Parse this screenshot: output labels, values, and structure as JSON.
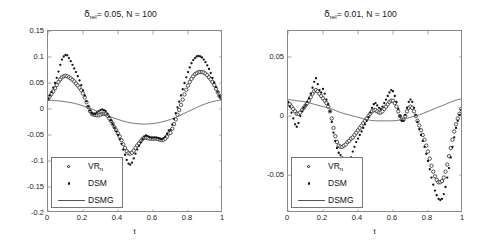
{
  "figure": {
    "axis_label_x": "t",
    "legend": [
      {
        "key": "vr",
        "label": "VR",
        "sublabel": "n",
        "marker": "open-circle"
      },
      {
        "key": "dsm",
        "label": "DSM",
        "sublabel": "",
        "marker": "filled-dot"
      },
      {
        "key": "dsmg",
        "label": "DSMG",
        "sublabel": "",
        "marker": "solid-line"
      }
    ],
    "colors": {
      "axis": "#8a8a8a",
      "marker": "#111111",
      "line": "#555555",
      "text": "#1a1a1a"
    }
  },
  "panels": [
    {
      "id": "left",
      "title_prefix": "δ",
      "title_sub": "rel",
      "title_rest": "= 0.05, N = 100",
      "title_full": "δrel = 0.05, N = 100"
    },
    {
      "id": "right",
      "title_prefix": "δ",
      "title_sub": "rel",
      "title_rest": "= 0.01, N = 100",
      "title_full": "δrel = 0.01, N = 100"
    }
  ],
  "chart_data": [
    {
      "type": "scatter",
      "panel": "left",
      "title": "δ_rel = 0.05, N = 100",
      "xlabel": "t",
      "ylabel": "",
      "xlim": [
        0,
        1
      ],
      "ylim": [
        -0.2,
        0.15
      ],
      "xticks": [
        0,
        0.2,
        0.4,
        0.6,
        0.8,
        1
      ],
      "xticklabels": [
        "0",
        "0.2",
        "0.4",
        "0.6",
        "0.8",
        "1"
      ],
      "yticks": [
        0.15,
        0.1,
        0.05,
        0,
        -0.05,
        -0.1,
        -0.15,
        -0.2
      ],
      "yticklabels": [
        "0.15",
        "0.1",
        "0.05",
        "0",
        "-0.05",
        "-0.1",
        "-0.15",
        "-0.2"
      ],
      "grid": false,
      "legend_position": "lower left",
      "series": [
        {
          "name": "VR_n",
          "marker": "open-circle",
          "x": [
            0.0,
            0.01,
            0.02,
            0.03,
            0.04,
            0.05,
            0.06,
            0.07,
            0.08,
            0.09,
            0.1,
            0.11,
            0.12,
            0.13,
            0.14,
            0.15,
            0.16,
            0.17,
            0.18,
            0.19,
            0.2,
            0.21,
            0.22,
            0.23,
            0.24,
            0.25,
            0.26,
            0.27,
            0.28,
            0.29,
            0.3,
            0.31,
            0.32,
            0.33,
            0.34,
            0.35,
            0.36,
            0.37,
            0.38,
            0.39,
            0.4,
            0.41,
            0.42,
            0.43,
            0.44,
            0.45,
            0.46,
            0.47,
            0.48,
            0.49,
            0.5,
            0.51,
            0.52,
            0.53,
            0.54,
            0.55,
            0.56,
            0.57,
            0.58,
            0.59,
            0.6,
            0.61,
            0.62,
            0.63,
            0.64,
            0.65,
            0.66,
            0.67,
            0.68,
            0.69,
            0.7,
            0.71,
            0.72,
            0.73,
            0.74,
            0.75,
            0.76,
            0.77,
            0.78,
            0.79,
            0.8,
            0.81,
            0.82,
            0.83,
            0.84,
            0.85,
            0.86,
            0.87,
            0.88,
            0.89,
            0.9,
            0.91,
            0.92,
            0.93,
            0.94,
            0.95,
            0.96,
            0.97,
            0.98,
            0.99,
            1.0
          ],
          "y": [
            0.019,
            0.024,
            0.029,
            0.034,
            0.04,
            0.046,
            0.052,
            0.057,
            0.061,
            0.063,
            0.064,
            0.063,
            0.061,
            0.059,
            0.056,
            0.053,
            0.049,
            0.045,
            0.041,
            0.036,
            0.03,
            0.022,
            0.013,
            0.004,
            -0.004,
            -0.009,
            -0.011,
            -0.011,
            -0.012,
            -0.012,
            -0.011,
            -0.009,
            -0.009,
            -0.01,
            -0.013,
            -0.018,
            -0.023,
            -0.029,
            -0.035,
            -0.041,
            -0.047,
            -0.053,
            -0.06,
            -0.068,
            -0.075,
            -0.081,
            -0.085,
            -0.086,
            -0.084,
            -0.08,
            -0.075,
            -0.07,
            -0.066,
            -0.062,
            -0.058,
            -0.055,
            -0.055,
            -0.056,
            -0.057,
            -0.057,
            -0.057,
            -0.057,
            -0.057,
            -0.058,
            -0.059,
            -0.06,
            -0.059,
            -0.057,
            -0.053,
            -0.047,
            -0.046,
            -0.038,
            -0.029,
            -0.02,
            -0.011,
            -0.002,
            0.008,
            0.018,
            0.028,
            0.037,
            0.045,
            0.052,
            0.058,
            0.063,
            0.067,
            0.069,
            0.071,
            0.071,
            0.071,
            0.07,
            0.068,
            0.065,
            0.061,
            0.057,
            0.052,
            0.046,
            0.039,
            0.032,
            0.025,
            0.021
          ]
        },
        {
          "name": "DSM",
          "marker": "filled-dot",
          "x": [
            0.0,
            0.01,
            0.02,
            0.03,
            0.04,
            0.05,
            0.06,
            0.07,
            0.08,
            0.09,
            0.1,
            0.11,
            0.12,
            0.13,
            0.14,
            0.15,
            0.16,
            0.17,
            0.18,
            0.19,
            0.2,
            0.21,
            0.22,
            0.23,
            0.24,
            0.25,
            0.26,
            0.27,
            0.28,
            0.29,
            0.3,
            0.31,
            0.32,
            0.33,
            0.34,
            0.35,
            0.36,
            0.37,
            0.38,
            0.39,
            0.4,
            0.41,
            0.42,
            0.43,
            0.44,
            0.45,
            0.46,
            0.47,
            0.48,
            0.49,
            0.5,
            0.51,
            0.52,
            0.53,
            0.54,
            0.55,
            0.56,
            0.57,
            0.58,
            0.59,
            0.6,
            0.61,
            0.62,
            0.63,
            0.64,
            0.65,
            0.66,
            0.67,
            0.68,
            0.69,
            0.7,
            0.71,
            0.72,
            0.73,
            0.74,
            0.75,
            0.76,
            0.77,
            0.78,
            0.79,
            0.8,
            0.81,
            0.82,
            0.83,
            0.84,
            0.85,
            0.86,
            0.87,
            0.88,
            0.89,
            0.9,
            0.91,
            0.92,
            0.93,
            0.94,
            0.95,
            0.96,
            0.97,
            0.98,
            0.99,
            1.0
          ],
          "y": [
            0.019,
            0.026,
            0.033,
            0.041,
            0.05,
            0.06,
            0.072,
            0.085,
            0.095,
            0.101,
            0.104,
            0.103,
            0.098,
            0.092,
            0.085,
            0.078,
            0.071,
            0.063,
            0.055,
            0.046,
            0.036,
            0.026,
            0.015,
            0.005,
            -0.003,
            -0.008,
            -0.01,
            -0.009,
            -0.006,
            -0.004,
            -0.002,
            -0.001,
            -0.002,
            -0.004,
            -0.009,
            -0.015,
            -0.022,
            -0.029,
            -0.036,
            -0.043,
            -0.05,
            -0.058,
            -0.067,
            -0.078,
            -0.088,
            -0.098,
            -0.105,
            -0.107,
            -0.103,
            -0.095,
            -0.086,
            -0.078,
            -0.071,
            -0.064,
            -0.058,
            -0.053,
            -0.051,
            -0.052,
            -0.054,
            -0.055,
            -0.055,
            -0.055,
            -0.055,
            -0.056,
            -0.057,
            -0.058,
            -0.056,
            -0.053,
            -0.048,
            -0.041,
            -0.04,
            -0.03,
            -0.019,
            -0.008,
            0.003,
            0.014,
            0.026,
            0.038,
            0.05,
            0.061,
            0.071,
            0.08,
            0.088,
            0.094,
            0.098,
            0.101,
            0.102,
            0.101,
            0.099,
            0.095,
            0.09,
            0.084,
            0.077,
            0.069,
            0.06,
            0.051,
            0.042,
            0.033,
            0.025,
            0.021
          ]
        },
        {
          "name": "DSMG",
          "marker": "solid-line",
          "x": [
            0.0,
            0.05,
            0.1,
            0.15,
            0.2,
            0.25,
            0.3,
            0.35,
            0.4,
            0.45,
            0.5,
            0.55,
            0.6,
            0.65,
            0.7,
            0.75,
            0.8,
            0.85,
            0.9,
            0.95,
            1.0
          ],
          "y": [
            0.017,
            0.016,
            0.014,
            0.011,
            0.006,
            0.0,
            -0.007,
            -0.014,
            -0.02,
            -0.025,
            -0.028,
            -0.029,
            -0.028,
            -0.025,
            -0.02,
            -0.013,
            -0.005,
            0.003,
            0.01,
            0.015,
            0.018
          ]
        }
      ]
    },
    {
      "type": "scatter",
      "panel": "right",
      "title": "δ_rel = 0.01, N = 100",
      "xlabel": "t",
      "ylabel": "",
      "xlim": [
        0,
        1
      ],
      "ylim": [
        -0.082,
        0.072
      ],
      "xticks": [
        0,
        0.2,
        0.4,
        0.6,
        0.8,
        1
      ],
      "xticklabels": [
        "0",
        "0.2",
        "0.4",
        "0.6",
        "0.8",
        "1"
      ],
      "yticks": [
        0.05,
        0,
        -0.05
      ],
      "yticklabels": [
        "0.05",
        "0",
        "-0.05"
      ],
      "grid": false,
      "legend_position": "lower left",
      "series": [
        {
          "name": "VR_n",
          "marker": "open-circle",
          "x": [
            0.0,
            0.01,
            0.02,
            0.03,
            0.04,
            0.05,
            0.06,
            0.07,
            0.08,
            0.09,
            0.1,
            0.11,
            0.12,
            0.13,
            0.14,
            0.15,
            0.16,
            0.17,
            0.18,
            0.19,
            0.2,
            0.21,
            0.22,
            0.23,
            0.24,
            0.25,
            0.26,
            0.27,
            0.28,
            0.29,
            0.3,
            0.31,
            0.32,
            0.33,
            0.34,
            0.35,
            0.36,
            0.37,
            0.38,
            0.39,
            0.4,
            0.41,
            0.42,
            0.43,
            0.44,
            0.45,
            0.46,
            0.47,
            0.48,
            0.49,
            0.5,
            0.51,
            0.52,
            0.53,
            0.54,
            0.55,
            0.56,
            0.57,
            0.58,
            0.59,
            0.6,
            0.61,
            0.62,
            0.63,
            0.64,
            0.65,
            0.66,
            0.67,
            0.68,
            0.69,
            0.7,
            0.71,
            0.72,
            0.73,
            0.74,
            0.75,
            0.76,
            0.77,
            0.78,
            0.79,
            0.8,
            0.81,
            0.82,
            0.83,
            0.84,
            0.85,
            0.86,
            0.87,
            0.88,
            0.89,
            0.9,
            0.91,
            0.92,
            0.93,
            0.94,
            0.95,
            0.96,
            0.97,
            0.98,
            0.99,
            1.0
          ],
          "y": [
            0.011,
            0.01,
            0.008,
            0.006,
            0.004,
            0.002,
            0.002,
            0.003,
            0.005,
            0.007,
            0.009,
            0.011,
            0.013,
            0.016,
            0.019,
            0.021,
            0.022,
            0.021,
            0.019,
            0.017,
            0.015,
            0.013,
            0.011,
            0.008,
            0.004,
            -0.002,
            -0.01,
            -0.017,
            -0.022,
            -0.025,
            -0.026,
            -0.026,
            -0.025,
            -0.024,
            -0.022,
            -0.021,
            -0.019,
            -0.018,
            -0.016,
            -0.014,
            -0.012,
            -0.01,
            -0.008,
            -0.006,
            -0.004,
            -0.002,
            0.0,
            0.002,
            0.004,
            0.005,
            0.005,
            0.004,
            0.003,
            0.003,
            0.004,
            0.006,
            0.008,
            0.01,
            0.012,
            0.013,
            0.013,
            0.011,
            0.008,
            0.004,
            0.0,
            -0.003,
            -0.003,
            0.0,
            0.004,
            0.007,
            0.008,
            0.007,
            0.004,
            0.0,
            -0.004,
            -0.008,
            -0.012,
            -0.016,
            -0.02,
            -0.025,
            -0.03,
            -0.036,
            -0.042,
            -0.047,
            -0.051,
            -0.054,
            -0.056,
            -0.056,
            -0.055,
            -0.052,
            -0.047,
            -0.041,
            -0.034,
            -0.027,
            -0.02,
            -0.013,
            -0.007,
            -0.002,
            0.002,
            0.006,
            0.009,
            0.011
          ]
        },
        {
          "name": "DSM",
          "marker": "filled-dot",
          "x": [
            0.0,
            0.01,
            0.02,
            0.03,
            0.04,
            0.05,
            0.06,
            0.07,
            0.08,
            0.09,
            0.1,
            0.11,
            0.12,
            0.13,
            0.14,
            0.15,
            0.16,
            0.17,
            0.18,
            0.19,
            0.2,
            0.21,
            0.22,
            0.23,
            0.24,
            0.25,
            0.26,
            0.27,
            0.28,
            0.29,
            0.3,
            0.31,
            0.32,
            0.33,
            0.34,
            0.35,
            0.36,
            0.37,
            0.38,
            0.39,
            0.4,
            0.41,
            0.42,
            0.43,
            0.44,
            0.45,
            0.46,
            0.47,
            0.48,
            0.49,
            0.5,
            0.51,
            0.52,
            0.53,
            0.54,
            0.55,
            0.56,
            0.57,
            0.58,
            0.59,
            0.6,
            0.61,
            0.62,
            0.63,
            0.64,
            0.65,
            0.66,
            0.67,
            0.68,
            0.69,
            0.7,
            0.71,
            0.72,
            0.73,
            0.74,
            0.75,
            0.76,
            0.77,
            0.78,
            0.79,
            0.8,
            0.81,
            0.82,
            0.83,
            0.84,
            0.85,
            0.86,
            0.87,
            0.88,
            0.89,
            0.9,
            0.91,
            0.92,
            0.93,
            0.94,
            0.95,
            0.96,
            0.97,
            0.98,
            0.99,
            1.0
          ],
          "y": [
            0.012,
            0.008,
            0.003,
            -0.002,
            -0.007,
            -0.009,
            -0.006,
            0.0,
            0.004,
            0.007,
            0.009,
            0.012,
            0.015,
            0.019,
            0.024,
            0.029,
            0.032,
            0.027,
            0.022,
            0.02,
            0.023,
            0.019,
            0.014,
            0.01,
            0.004,
            -0.005,
            -0.014,
            -0.021,
            -0.027,
            -0.031,
            -0.033,
            -0.035,
            -0.038,
            -0.04,
            -0.042,
            -0.04,
            -0.035,
            -0.03,
            -0.026,
            -0.022,
            -0.019,
            -0.016,
            -0.013,
            -0.01,
            -0.007,
            -0.004,
            -0.001,
            0.003,
            0.007,
            0.01,
            0.011,
            0.009,
            0.007,
            0.006,
            0.008,
            0.011,
            0.014,
            0.017,
            0.02,
            0.022,
            0.021,
            0.017,
            0.012,
            0.006,
            0.0,
            -0.004,
            -0.004,
            0.001,
            0.007,
            0.012,
            0.014,
            0.012,
            0.007,
            0.001,
            -0.005,
            -0.011,
            -0.016,
            -0.021,
            -0.026,
            -0.032,
            -0.038,
            -0.045,
            -0.052,
            -0.058,
            -0.063,
            -0.067,
            -0.07,
            -0.071,
            -0.07,
            -0.066,
            -0.06,
            -0.052,
            -0.044,
            -0.035,
            -0.026,
            -0.018,
            -0.01,
            -0.004,
            0.001,
            0.005,
            0.009,
            0.012
          ]
        },
        {
          "name": "DSMG",
          "marker": "solid-line",
          "x": [
            0.0,
            0.05,
            0.1,
            0.15,
            0.2,
            0.25,
            0.3,
            0.35,
            0.4,
            0.45,
            0.5,
            0.55,
            0.6,
            0.65,
            0.7,
            0.75,
            0.8,
            0.85,
            0.9,
            0.95,
            1.0
          ],
          "y": [
            0.014,
            0.013,
            0.012,
            0.01,
            0.008,
            0.006,
            0.003,
            0.001,
            -0.001,
            -0.003,
            -0.004,
            -0.004,
            -0.004,
            -0.003,
            -0.001,
            0.001,
            0.004,
            0.007,
            0.01,
            0.013,
            0.015
          ]
        }
      ]
    }
  ]
}
